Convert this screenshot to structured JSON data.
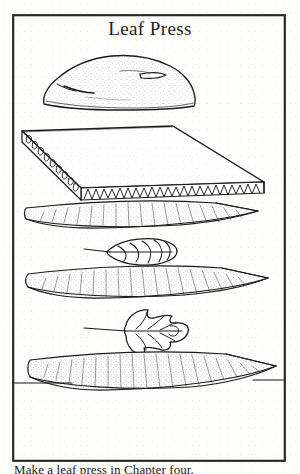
{
  "document": {
    "title": "Leaf Press",
    "caption": "Make a leaf press in Chapter four.",
    "frame_color": "#1a1a1a",
    "ink_color": "#1b1b1b",
    "paper_color": "#fdfdfc"
  },
  "figure": {
    "name": "leaf-press-exploded-diagram",
    "parts": [
      {
        "id": "weight-rock",
        "label": "rock weight",
        "order": 1
      },
      {
        "id": "corrugated-sheet",
        "label": "corrugated cardboard sheet",
        "order": 2
      },
      {
        "id": "blotter-sheet-top",
        "label": "blotter paper",
        "order": 3
      },
      {
        "id": "leaf-specimen-oval",
        "label": "oval leaf specimen",
        "order": 4
      },
      {
        "id": "blotter-sheet-mid",
        "label": "blotter paper",
        "order": 5
      },
      {
        "id": "leaf-specimen-lobed",
        "label": "lobed leaf specimen",
        "order": 6
      },
      {
        "id": "blotter-sheet-base",
        "label": "blotter paper",
        "order": 7
      },
      {
        "id": "table-line",
        "label": "table surface line",
        "order": 8
      }
    ]
  }
}
